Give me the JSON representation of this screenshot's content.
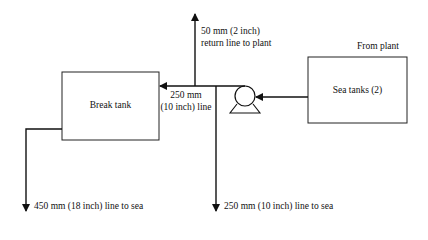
{
  "diagram": {
    "nodes": {
      "break_tank": {
        "label": "Break tank"
      },
      "sea_tanks": {
        "label": "Sea tanks (2)"
      },
      "pump": {
        "label": ""
      }
    },
    "labels": {
      "from_plant": "From plant",
      "return_line_1": "50 mm (2 inch)",
      "return_line_2": "return line to plant",
      "main_line_1": "250 mm",
      "main_line_2": "(10 inch) line",
      "outlet_break_tank": "450 mm (18 inch) line to sea",
      "outlet_main": "250 mm (10 inch) line to sea"
    },
    "edges": [
      {
        "from": "sea_tanks",
        "to": "pump"
      },
      {
        "from": "pump",
        "to": "break_tank",
        "label": "250 mm (10 inch) line"
      },
      {
        "from": "junction",
        "to": "plant",
        "label": "50 mm (2 inch) return line to plant"
      },
      {
        "from": "junction",
        "to": "sea",
        "label": "250 mm (10 inch) line to sea"
      },
      {
        "from": "break_tank",
        "to": "sea",
        "label": "450 mm (18 inch) line to sea"
      }
    ],
    "colors": {
      "line": "#111111",
      "background": "#ffffff"
    }
  }
}
